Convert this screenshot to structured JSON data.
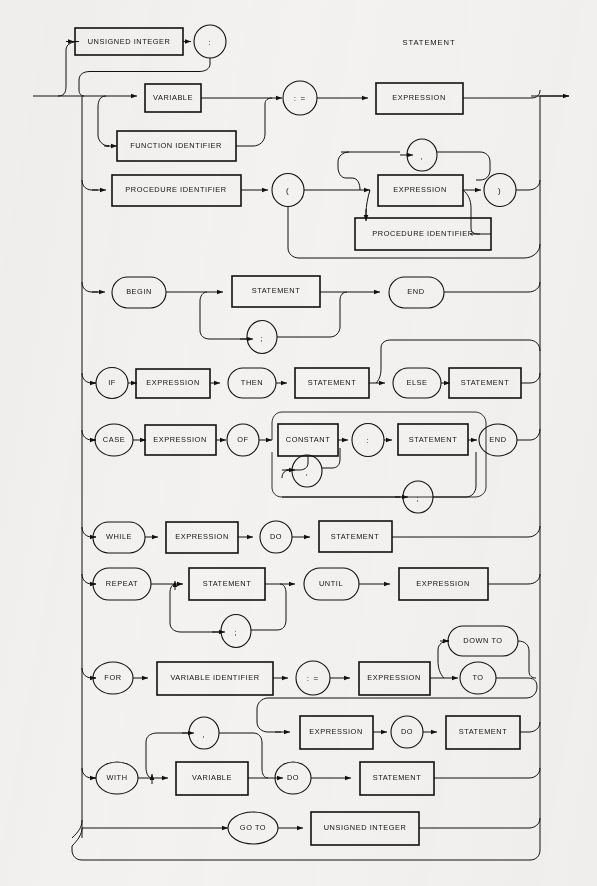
{
  "diagram": {
    "title": "STATEMENT",
    "type": "railroad-syntax-diagram",
    "language": "Pascal",
    "background_color": "#f3f2f0",
    "line_color": "#111111"
  },
  "nodes": {
    "unsigned_integer": "UNSIGNED INTEGER",
    "colon": ":",
    "variable": "VARIABLE",
    "assign": ": =",
    "expression": "EXPRESSION",
    "function_identifier": "FUNCTION IDENTIFIER",
    "procedure_identifier": "PROCEDURE IDENTIFIER",
    "lparen": "(",
    "rparen": ")",
    "comma": ",",
    "semicolon": ";",
    "begin": "BEGIN",
    "statement": "STATEMENT",
    "end": "END",
    "if": "IF",
    "then": "THEN",
    "else": "ELSE",
    "case": "CASE",
    "of": "OF",
    "constant": "CONSTANT",
    "while": "WHILE",
    "do": "DO",
    "repeat": "REPEAT",
    "until": "UNTIL",
    "for": "FOR",
    "variable_identifier": "VARIABLE IDENTIFIER",
    "to": "TO",
    "down_to": "DOWN TO",
    "with": "WITH",
    "go_to": "GO TO"
  },
  "rows": [
    {
      "id": "label-row",
      "name": "label-statement",
      "items": [
        "UNSIGNED INTEGER",
        ":"
      ]
    },
    {
      "id": "assignment-row",
      "name": "assignment",
      "items": [
        "VARIABLE",
        ": =",
        "EXPRESSION"
      ]
    },
    {
      "id": "function-row",
      "name": "function-assignment",
      "items": [
        "FUNCTION IDENTIFIER"
      ]
    },
    {
      "id": "procedure-call-row",
      "name": "procedure-call",
      "items": [
        "PROCEDURE IDENTIFIER",
        "(",
        "EXPRESSION",
        ",",
        "PROCEDURE IDENTIFIER",
        ")"
      ]
    },
    {
      "id": "compound-row",
      "name": "compound-statement",
      "items": [
        "BEGIN",
        "STATEMENT",
        ";",
        "END"
      ]
    },
    {
      "id": "if-row",
      "name": "if-statement",
      "items": [
        "IF",
        "EXPRESSION",
        "THEN",
        "STATEMENT",
        "ELSE",
        "STATEMENT"
      ]
    },
    {
      "id": "case-row",
      "name": "case-statement",
      "items": [
        "CASE",
        "EXPRESSION",
        "OF",
        "CONSTANT",
        ",",
        ":",
        "STATEMENT",
        ";",
        "END"
      ]
    },
    {
      "id": "while-row",
      "name": "while-statement",
      "items": [
        "WHILE",
        "EXPRESSION",
        "DO",
        "STATEMENT"
      ]
    },
    {
      "id": "repeat-row",
      "name": "repeat-statement",
      "items": [
        "REPEAT",
        "STATEMENT",
        ";",
        "UNTIL",
        "EXPRESSION"
      ]
    },
    {
      "id": "for-row",
      "name": "for-statement",
      "items": [
        "FOR",
        "VARIABLE IDENTIFIER",
        ": =",
        "EXPRESSION",
        "DOWN TO",
        "TO",
        "EXPRESSION",
        "DO",
        "STATEMENT"
      ]
    },
    {
      "id": "with-row",
      "name": "with-statement",
      "items": [
        "WITH",
        ",",
        "VARIABLE",
        "DO",
        "STATEMENT"
      ]
    },
    {
      "id": "goto-row",
      "name": "goto-statement",
      "items": [
        "GO TO",
        "UNSIGNED INTEGER"
      ]
    }
  ]
}
